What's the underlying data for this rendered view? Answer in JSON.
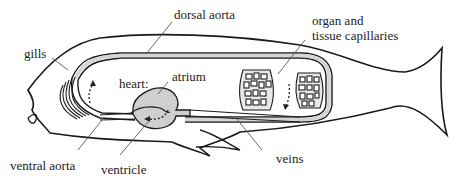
{
  "diagram": {
    "colors": {
      "outline": "#1a1a1a",
      "vessel_fill": "#d4d4d4",
      "heart_fill": "#cfcfcf",
      "leader": "#555555"
    },
    "labels": {
      "dorsal_aorta": "dorsal aorta",
      "gills": "gills",
      "organ_line1": "organ and",
      "organ_line2": "tissue capillaries",
      "heart": "heart:",
      "atrium": "atrium",
      "ventral_aorta": "ventral aorta",
      "ventricle": "ventricle",
      "veins": "veins"
    }
  }
}
